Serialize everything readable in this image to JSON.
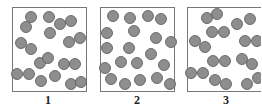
{
  "diagram": {
    "type": "particle-boxes",
    "colors": {
      "background": "#ffffff",
      "box_border": "#777777",
      "particle_fill": "#8e8e8e",
      "particle_stroke": "#555555",
      "label": "#222222"
    },
    "particle_radius": 5.5,
    "panels": [
      {
        "label": "1",
        "box": {
          "x": 12,
          "y": 7,
          "w": 74,
          "h": 84
        },
        "label_pos": {
          "x": 48,
          "y": 94
        },
        "particles": [
          [
            31,
            17
          ],
          [
            49,
            17
          ],
          [
            26,
            27
          ],
          [
            60,
            24
          ],
          [
            71,
            21
          ],
          [
            50,
            33
          ],
          [
            21,
            43
          ],
          [
            31,
            49
          ],
          [
            69,
            42
          ],
          [
            80,
            38
          ],
          [
            40,
            63
          ],
          [
            48,
            58
          ],
          [
            64,
            64
          ],
          [
            75,
            64
          ],
          [
            17,
            74
          ],
          [
            29,
            74
          ],
          [
            41,
            81
          ],
          [
            55,
            76
          ],
          [
            71,
            84
          ],
          [
            81,
            82
          ]
        ]
      },
      {
        "label": "2",
        "box": {
          "x": 100,
          "y": 7,
          "w": 74,
          "h": 84
        },
        "label_pos": {
          "x": 137,
          "y": 94
        },
        "particles": [
          [
            113,
            16
          ],
          [
            130,
            18
          ],
          [
            148,
            16
          ],
          [
            161,
            19
          ],
          [
            107,
            33
          ],
          [
            134,
            31
          ],
          [
            156,
            38
          ],
          [
            171,
            42
          ],
          [
            107,
            48
          ],
          [
            129,
            48
          ],
          [
            151,
            54
          ],
          [
            164,
            65
          ],
          [
            121,
            62
          ],
          [
            137,
            63
          ],
          [
            105,
            68
          ],
          [
            111,
            79
          ],
          [
            125,
            84
          ],
          [
            140,
            80
          ],
          [
            157,
            78
          ],
          [
            170,
            84
          ]
        ]
      },
      {
        "label": "3",
        "box": {
          "x": 187,
          "y": 7,
          "w": 76,
          "h": 84
        },
        "label_pos": {
          "x": 226,
          "y": 94
        },
        "particles": [
          [
            207,
            18
          ],
          [
            217,
            14
          ],
          [
            237,
            24
          ],
          [
            250,
            19
          ],
          [
            212,
            32
          ],
          [
            224,
            32
          ],
          [
            195,
            41
          ],
          [
            205,
            47
          ],
          [
            245,
            41
          ],
          [
            257,
            41
          ],
          [
            213,
            61
          ],
          [
            225,
            61
          ],
          [
            242,
            59
          ],
          [
            252,
            64
          ],
          [
            191,
            73
          ],
          [
            203,
            73
          ],
          [
            215,
            80
          ],
          [
            226,
            84
          ],
          [
            247,
            84
          ],
          [
            258,
            78
          ]
        ]
      }
    ]
  }
}
